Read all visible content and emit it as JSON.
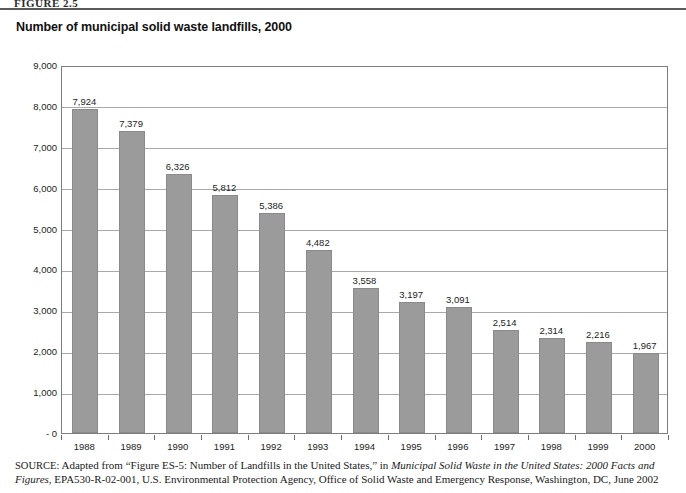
{
  "page": {
    "figure_label": "FIGURE 2.5"
  },
  "chart_data": {
    "type": "bar",
    "title": "Number of municipal solid waste landfills, 2000",
    "xlabel": "",
    "ylabel": "",
    "ylim": [
      0,
      9000
    ],
    "grid": true,
    "legend": "none",
    "categories": [
      "1988",
      "1989",
      "1990",
      "1991",
      "1992",
      "1993",
      "1994",
      "1995",
      "1996",
      "1997",
      "1998",
      "1999",
      "2000"
    ],
    "values": [
      7924,
      7379,
      6326,
      5812,
      5386,
      4482,
      3558,
      3197,
      3091,
      2514,
      2314,
      2216,
      1967
    ],
    "value_labels": [
      "7,924",
      "7,379",
      "6,326",
      "5,812",
      "5,386",
      "4,482",
      "3,558",
      "3,197",
      "3,091",
      "2,514",
      "2,314",
      "2,216",
      "1,967"
    ],
    "y_ticks": [
      0,
      1000,
      2000,
      3000,
      4000,
      5000,
      6000,
      7000,
      8000,
      9000
    ],
    "y_tick_labels": [
      "- 0",
      "1,000",
      "2,000",
      "3,000",
      "4,000",
      "5,000",
      "6,000",
      "7,000",
      "8,000",
      "9,000"
    ],
    "bar_color": "#9b9b9b",
    "grid_color": "#a9a9a9",
    "frame_color": "#7d7d7d"
  },
  "source": {
    "label": "SOURCE:",
    "text_before_italic": " Adapted from “Figure ES-5: Number of Landfills in the United States,” in ",
    "italic_title": "Municipal Solid Waste in the United States: 2000 Facts and Figures,",
    "text_after_italic": " EPA530-R-02-001, U.S. Environmental Protection Agency, Office of Solid Waste and Emergency Response, Washington, DC, June 2002"
  }
}
